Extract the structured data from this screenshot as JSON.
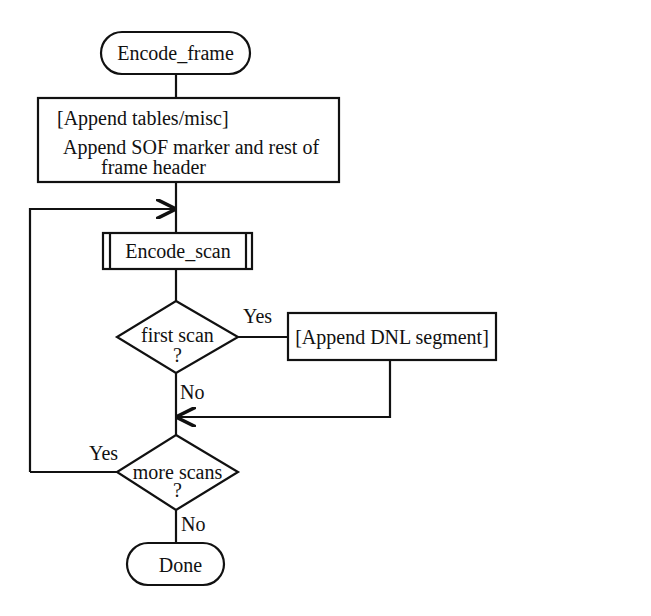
{
  "diagram": {
    "type": "flowchart",
    "colors": {
      "stroke": "#111111",
      "background": "#ffffff",
      "text": "#111111"
    },
    "nodes": {
      "start": {
        "shape": "terminator",
        "label": "Encode_frame"
      },
      "frame_header": {
        "shape": "process",
        "line1": "[Append tables/misc]",
        "line2": "Append SOF marker and rest of",
        "line3": "frame header"
      },
      "encode_scan": {
        "shape": "predefined-process",
        "label": "Encode_scan"
      },
      "first_scan": {
        "shape": "decision",
        "line1": "first scan",
        "line2": "?"
      },
      "dnl": {
        "shape": "process",
        "label": "[Append DNL segment]"
      },
      "more_scans": {
        "shape": "decision",
        "line1": "more scans",
        "line2": "?"
      },
      "end": {
        "shape": "terminator",
        "label": "Done"
      }
    },
    "edges": {
      "first_scan_yes": "Yes",
      "first_scan_no": "No",
      "more_scans_yes": "Yes",
      "more_scans_no": "No"
    }
  }
}
